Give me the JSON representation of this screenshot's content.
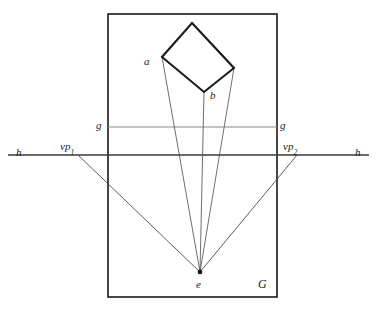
{
  "figure": {
    "type": "perspective-construction-diagram",
    "background_color": "#ffffff",
    "width": 377,
    "height": 313
  },
  "labels": {
    "a": "a",
    "b": "b",
    "e": "e",
    "g_left": "g",
    "g_right": "g",
    "h_left": "h",
    "h_right": "h",
    "G": "G",
    "vp1_base": "vp",
    "vp1_sub": "1",
    "vp2_base": "vp",
    "vp2_sub": "2"
  },
  "colors": {
    "stroke_dark": "#1a1a1a",
    "stroke_thin": "#4a4a4a",
    "stroke_gray": "#8a8a8a",
    "text": "#1a1a1a"
  },
  "geometry": {
    "picture_plane_rect": {
      "x": 108,
      "y": 14,
      "width": 169,
      "height": 283
    },
    "ground_line_g": {
      "x1": 108,
      "y1": 127,
      "x2": 277,
      "y2": 127
    },
    "horizon_line_h": {
      "x1": 8,
      "y1": 155,
      "x2": 369,
      "y2": 155
    },
    "station_point_e": {
      "x": 200,
      "y": 272
    },
    "vanishing_point_1": {
      "x": 78,
      "y": 155
    },
    "vanishing_point_2": {
      "x": 297,
      "y": 155
    },
    "square_vertices": {
      "top": {
        "x": 192,
        "y": 23
      },
      "left_a": {
        "x": 162,
        "y": 57
      },
      "bottom": {
        "x": 204,
        "y": 92
      },
      "right_b": {
        "x": 234,
        "y": 68
      }
    },
    "sight_lines_from_e": [
      {
        "to": "left_a"
      },
      {
        "to": "bottom"
      },
      {
        "to": "right_b"
      }
    ],
    "vanishing_rays": [
      {
        "from": "vanishing_point_1",
        "to": "station_point_e"
      },
      {
        "from": "vanishing_point_2",
        "to": "station_point_e"
      }
    ]
  },
  "label_positions": {
    "a": {
      "x": 144,
      "y": 56
    },
    "b": {
      "x": 210,
      "y": 90
    },
    "e": {
      "x": 196,
      "y": 279
    },
    "g_left": {
      "x": 96,
      "y": 120
    },
    "g_right": {
      "x": 280,
      "y": 120
    },
    "h_left": {
      "x": 16,
      "y": 147
    },
    "h_right": {
      "x": 355,
      "y": 147
    },
    "G": {
      "x": 258,
      "y": 278
    },
    "vp1": {
      "x": 60,
      "y": 141
    },
    "vp2": {
      "x": 283,
      "y": 141
    }
  }
}
